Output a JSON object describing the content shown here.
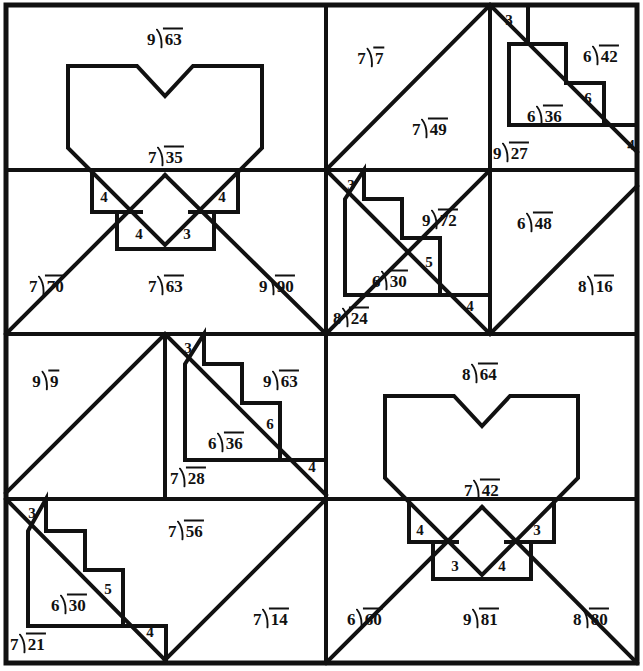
{
  "page": {
    "width": 643,
    "height": 671,
    "ink_color": "#111111",
    "paper_color": "#ffffff"
  },
  "legend": {
    "division_symbol": "division-bracket",
    "note": "Each cell contains a division expression written in long-division bracket form, or a bare quotient digit."
  },
  "quadrants": [
    {
      "name": "top-left",
      "motif": "heart",
      "problems": [
        "9)63",
        "7)35",
        "7)70",
        "7)63",
        "9)90"
      ],
      "step_digits": [
        "4",
        "4",
        "4",
        "3"
      ]
    },
    {
      "name": "top-right",
      "motif": "staircase",
      "problems": [
        "7)7",
        "7)49",
        "6)42",
        "6)36",
        "9)27",
        "9)72",
        "6)30",
        "6)48",
        "8)16",
        "8)24"
      ],
      "step_digits": [
        "3",
        "6",
        "4",
        "3",
        "5",
        "4"
      ]
    },
    {
      "name": "bottom-left",
      "motif": "staircase",
      "problems": [
        "9)9",
        "9)63",
        "6)36",
        "7)28",
        "7)56",
        "6)30",
        "7)21",
        "7)14"
      ],
      "step_digits": [
        "3",
        "6",
        "4",
        "3",
        "5",
        "4"
      ]
    },
    {
      "name": "bottom-right",
      "motif": "heart",
      "problems": [
        "8)64",
        "7)42",
        "6)60",
        "9)81",
        "8)80"
      ],
      "step_digits": [
        "4",
        "3",
        "3",
        "4"
      ]
    }
  ],
  "labels": [
    {
      "id": "l01",
      "x": 165,
      "y": 38,
      "dividend": "63",
      "divisor": "9",
      "kind": "division"
    },
    {
      "id": "l02",
      "x": 166,
      "y": 156,
      "dividend": "35",
      "divisor": "7",
      "kind": "division"
    },
    {
      "id": "l03",
      "x": 47,
      "y": 285,
      "dividend": "70",
      "divisor": "7",
      "kind": "division"
    },
    {
      "id": "l04",
      "x": 166,
      "y": 285,
      "dividend": "63",
      "divisor": "7",
      "kind": "division"
    },
    {
      "id": "l05",
      "x": 277,
      "y": 285,
      "dividend": "90",
      "divisor": "9",
      "kind": "division"
    },
    {
      "id": "l06",
      "x": 104,
      "y": 197,
      "text": "4",
      "kind": "digit"
    },
    {
      "id": "l07",
      "x": 222,
      "y": 197,
      "text": "4",
      "kind": "digit"
    },
    {
      "id": "l08",
      "x": 139,
      "y": 234,
      "text": "4",
      "kind": "digit"
    },
    {
      "id": "l09",
      "x": 187,
      "y": 234,
      "text": "3",
      "kind": "digit"
    },
    {
      "id": "l10",
      "x": 371,
      "y": 57,
      "dividend": "7",
      "divisor": "7",
      "kind": "division"
    },
    {
      "id": "l11",
      "x": 430,
      "y": 128,
      "dividend": "49",
      "divisor": "7",
      "kind": "division"
    },
    {
      "id": "l12",
      "x": 601,
      "y": 55,
      "dividend": "42",
      "divisor": "6",
      "kind": "division"
    },
    {
      "id": "l13",
      "x": 545,
      "y": 115,
      "dividend": "36",
      "divisor": "6",
      "kind": "division"
    },
    {
      "id": "l14",
      "x": 511,
      "y": 152,
      "dividend": "27",
      "divisor": "9",
      "kind": "division"
    },
    {
      "id": "l15",
      "x": 509,
      "y": 20,
      "text": "3",
      "kind": "digit"
    },
    {
      "id": "l16",
      "x": 588,
      "y": 98,
      "text": "6",
      "kind": "digit"
    },
    {
      "id": "l17",
      "x": 631,
      "y": 145,
      "text": "4",
      "kind": "digit"
    },
    {
      "id": "l18",
      "x": 440,
      "y": 219,
      "dividend": "72",
      "divisor": "9",
      "kind": "division"
    },
    {
      "id": "l19",
      "x": 390,
      "y": 280,
      "dividend": "30",
      "divisor": "6",
      "kind": "division"
    },
    {
      "id": "l20",
      "x": 351,
      "y": 317,
      "dividend": "24",
      "divisor": "8",
      "kind": "division"
    },
    {
      "id": "l21",
      "x": 535,
      "y": 222,
      "dividend": "48",
      "divisor": "6",
      "kind": "division"
    },
    {
      "id": "l22",
      "x": 596,
      "y": 285,
      "dividend": "16",
      "divisor": "8",
      "kind": "division"
    },
    {
      "id": "l23",
      "x": 351,
      "y": 185,
      "text": "3",
      "kind": "digit"
    },
    {
      "id": "l24",
      "x": 429,
      "y": 262,
      "text": "5",
      "kind": "digit"
    },
    {
      "id": "l25",
      "x": 470,
      "y": 306,
      "text": "4",
      "kind": "digit"
    },
    {
      "id": "l26",
      "x": 46,
      "y": 380,
      "dividend": "9",
      "divisor": "9",
      "kind": "division"
    },
    {
      "id": "l27",
      "x": 281,
      "y": 380,
      "dividend": "63",
      "divisor": "9",
      "kind": "division"
    },
    {
      "id": "l28",
      "x": 226,
      "y": 442,
      "dividend": "36",
      "divisor": "6",
      "kind": "division"
    },
    {
      "id": "l29",
      "x": 188,
      "y": 477,
      "dividend": "28",
      "divisor": "7",
      "kind": "division"
    },
    {
      "id": "l30",
      "x": 186,
      "y": 530,
      "dividend": "56",
      "divisor": "7",
      "kind": "division"
    },
    {
      "id": "l31",
      "x": 69,
      "y": 604,
      "dividend": "30",
      "divisor": "6",
      "kind": "division"
    },
    {
      "id": "l32",
      "x": 28,
      "y": 643,
      "dividend": "21",
      "divisor": "7",
      "kind": "division"
    },
    {
      "id": "l33",
      "x": 271,
      "y": 618,
      "dividend": "14",
      "divisor": "7",
      "kind": "division"
    },
    {
      "id": "l34",
      "x": 188,
      "y": 348,
      "text": "3",
      "kind": "digit"
    },
    {
      "id": "l35",
      "x": 270,
      "y": 424,
      "text": "6",
      "kind": "digit"
    },
    {
      "id": "l36",
      "x": 312,
      "y": 467,
      "text": "4",
      "kind": "digit"
    },
    {
      "id": "l37",
      "x": 32,
      "y": 513,
      "text": "3",
      "kind": "digit"
    },
    {
      "id": "l38",
      "x": 108,
      "y": 589,
      "text": "5",
      "kind": "digit"
    },
    {
      "id": "l39",
      "x": 150,
      "y": 632,
      "text": "4",
      "kind": "digit"
    },
    {
      "id": "l40",
      "x": 480,
      "y": 373,
      "dividend": "64",
      "divisor": "8",
      "kind": "division"
    },
    {
      "id": "l41",
      "x": 482,
      "y": 489,
      "dividend": "42",
      "divisor": "7",
      "kind": "division"
    },
    {
      "id": "l42",
      "x": 365,
      "y": 618,
      "dividend": "60",
      "divisor": "6",
      "kind": "division"
    },
    {
      "id": "l43",
      "x": 481,
      "y": 618,
      "dividend": "81",
      "divisor": "9",
      "kind": "division"
    },
    {
      "id": "l44",
      "x": 591,
      "y": 618,
      "dividend": "80",
      "divisor": "8",
      "kind": "division"
    },
    {
      "id": "l45",
      "x": 420,
      "y": 530,
      "text": "4",
      "kind": "digit"
    },
    {
      "id": "l46",
      "x": 537,
      "y": 530,
      "text": "3",
      "kind": "digit"
    },
    {
      "id": "l47",
      "x": 455,
      "y": 566,
      "text": "3",
      "kind": "digit"
    },
    {
      "id": "l48",
      "x": 502,
      "y": 566,
      "text": "4",
      "kind": "digit"
    }
  ]
}
